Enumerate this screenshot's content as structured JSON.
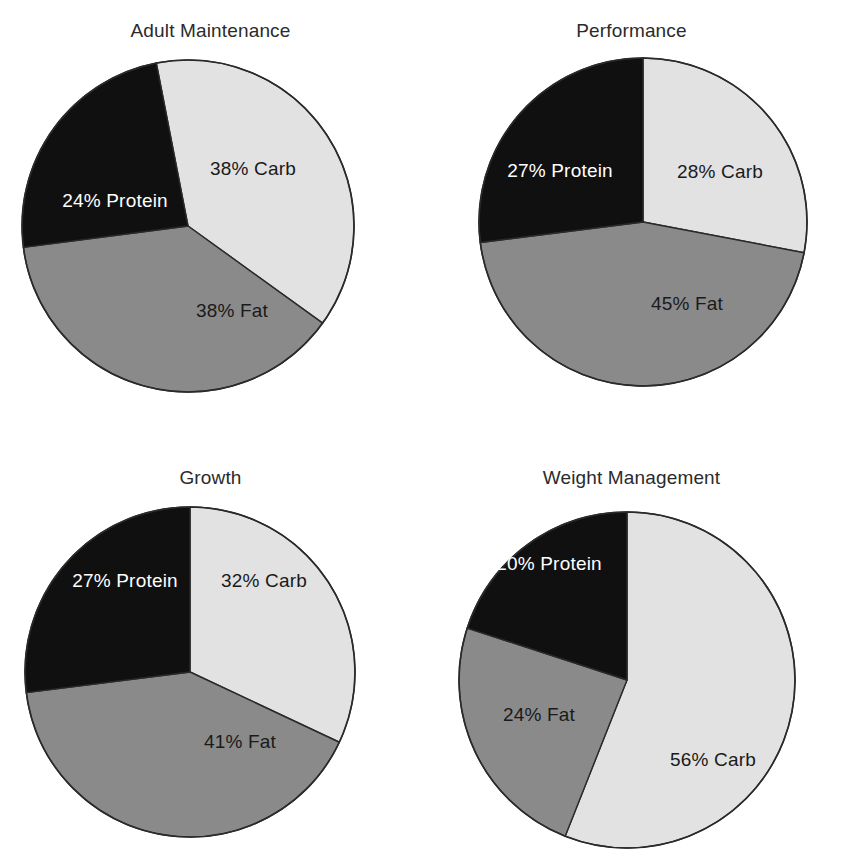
{
  "figure": {
    "background_color": "#ffffff",
    "type": "pie-chart-grid",
    "rows": 2,
    "columns": 2
  },
  "palette": {
    "carb_color": "#e2e2e2",
    "fat_color": "#8a8a8a",
    "protein_color": "#101010",
    "outline_color": "#2a2a2a",
    "label_dark": "#1a1a1a",
    "label_light": "#ffffff",
    "title_color": "#2b2b2b"
  },
  "chart_data": [
    {
      "type": "pie",
      "title": "Adult Maintenance",
      "labels": [
        "Carb",
        "Fat",
        "Protein"
      ],
      "values": [
        38,
        38,
        24
      ],
      "data_labels": [
        "38% Carb",
        "38% Fat",
        "24% Protein"
      ],
      "colors": [
        "#e2e2e2",
        "#8a8a8a",
        "#101010"
      ],
      "start_angle_deg": -11,
      "label_text_colors": [
        "dark",
        "dark",
        "light"
      ],
      "units": "percent"
    },
    {
      "type": "pie",
      "title": "Performance",
      "labels": [
        "Carb",
        "Fat",
        "Protein"
      ],
      "values": [
        28,
        45,
        27
      ],
      "data_labels": [
        "28% Carb",
        "45% Fat",
        "27% Protein"
      ],
      "colors": [
        "#e2e2e2",
        "#8a8a8a",
        "#101010"
      ],
      "start_angle_deg": 0,
      "label_text_colors": [
        "dark",
        "dark",
        "light"
      ],
      "units": "percent"
    },
    {
      "type": "pie",
      "title": "Growth",
      "labels": [
        "Carb",
        "Fat",
        "Protein"
      ],
      "values": [
        32,
        41,
        27
      ],
      "data_labels": [
        "32% Carb",
        "41% Fat",
        "27%  Protein"
      ],
      "colors": [
        "#e2e2e2",
        "#8a8a8a",
        "#101010"
      ],
      "start_angle_deg": 0,
      "label_text_colors": [
        "dark",
        "dark",
        "light"
      ],
      "units": "percent"
    },
    {
      "type": "pie",
      "title": "Weight Management",
      "labels": [
        "Carb",
        "Fat",
        "Protein"
      ],
      "values": [
        56,
        24,
        20
      ],
      "data_labels": [
        "56% Carb",
        "24% Fat",
        "20% Protein"
      ],
      "colors": [
        "#e2e2e2",
        "#8a8a8a",
        "#101010"
      ],
      "start_angle_deg": 0,
      "label_text_colors": [
        "dark",
        "dark",
        "light"
      ],
      "units": "percent"
    }
  ],
  "geometry": [
    {
      "cx": 188,
      "cy": 226,
      "r": 166,
      "label_positions": [
        [
          253,
          170
        ],
        [
          232,
          312
        ],
        [
          115,
          202
        ]
      ]
    },
    {
      "cx": 643,
      "cy": 222,
      "r": 164,
      "label_positions": [
        [
          720,
          173
        ],
        [
          687,
          305
        ],
        [
          560,
          172
        ]
      ]
    },
    {
      "cx": 190,
      "cy": 672,
      "r": 165,
      "label_positions": [
        [
          264,
          582
        ],
        [
          240,
          743
        ],
        [
          125,
          582
        ]
      ]
    },
    {
      "cx": 627,
      "cy": 680,
      "r": 168,
      "label_positions": [
        [
          713,
          761
        ],
        [
          539,
          716
        ],
        [
          549,
          565
        ]
      ]
    }
  ]
}
